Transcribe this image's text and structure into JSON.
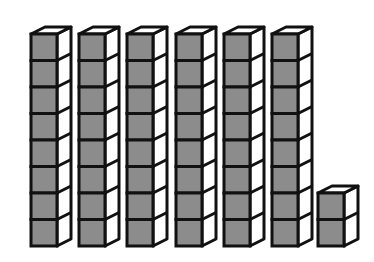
{
  "diagram": {
    "colors": {
      "front_face": "#8c8c8c",
      "side_face": "#ffffff",
      "top_face": "#ffffff",
      "outline": "#111111",
      "background": "#ffffff"
    },
    "geometry": {
      "baseline_y": 246,
      "cube_height": 26.5,
      "front_width": 26,
      "depth_x": 14,
      "depth_y": 7
    },
    "stacks": [
      {
        "id": "rod-1",
        "x": 31,
        "cubes": 8
      },
      {
        "id": "rod-2",
        "x": 79,
        "cubes": 8
      },
      {
        "id": "rod-3",
        "x": 127,
        "cubes": 8
      },
      {
        "id": "rod-4",
        "x": 176,
        "cubes": 8
      },
      {
        "id": "rod-5",
        "x": 224,
        "cubes": 8
      },
      {
        "id": "rod-6",
        "x": 272,
        "cubes": 8
      },
      {
        "id": "units",
        "x": 318,
        "cubes": 2
      }
    ],
    "total_cubes": 50
  }
}
